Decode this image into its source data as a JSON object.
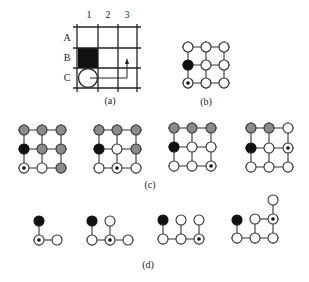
{
  "colors": {
    "black": "#111111",
    "gray": "#8a8a8a",
    "white": "#ffffff",
    "stroke": "#333333"
  },
  "panel_a": {
    "caption": "(a)",
    "col_labels": [
      "1",
      "2",
      "3"
    ],
    "row_labels": [
      "A",
      "B",
      "C"
    ],
    "obstacle_cell": "B1",
    "robot_cell": "C1",
    "path_description": "arrow from C1 right to column 3 then up toward B3"
  },
  "panel_b": {
    "caption": "(b)",
    "grid": "3x3 nodes",
    "nodes": [
      [
        "white",
        "white",
        "white"
      ],
      [
        "black",
        "white",
        "white"
      ],
      [
        "target",
        "white",
        "white"
      ]
    ]
  },
  "panel_c": {
    "caption": "(c)",
    "grids": [
      [
        [
          "gray",
          "gray",
          "gray"
        ],
        [
          "black",
          "gray",
          "gray"
        ],
        [
          "target",
          "white",
          "gray"
        ]
      ],
      [
        [
          "gray",
          "gray",
          "gray"
        ],
        [
          "black",
          "white",
          "gray"
        ],
        [
          "white",
          "target",
          "white"
        ]
      ],
      [
        [
          "gray",
          "gray",
          "gray"
        ],
        [
          "black",
          "white",
          "white"
        ],
        [
          "white",
          "white",
          "target"
        ]
      ],
      [
        [
          "gray",
          "gray",
          "white"
        ],
        [
          "black",
          "white",
          "target"
        ],
        [
          "white",
          "white",
          "white"
        ]
      ]
    ]
  },
  "panel_d": {
    "caption": "(d)",
    "trees": [
      "black above target; target connects right to white",
      "black above white; white-target-white in row; white above target",
      "black above white; three bottom nodes white-white-target; whites above middle and target",
      "black above white; bottom row white-white-white; white above middle; target above right; white above target"
    ]
  }
}
